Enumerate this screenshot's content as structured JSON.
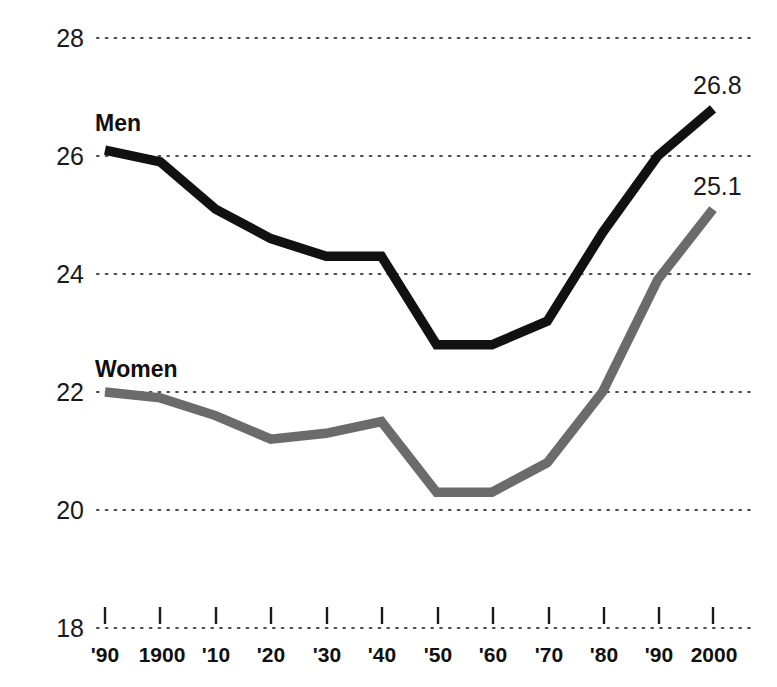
{
  "chart_data": {
    "type": "line",
    "title": "",
    "subtitle": "",
    "xlabel": "",
    "ylabel": "",
    "categories": [
      "'90",
      "1900",
      "'10",
      "'20",
      "'30",
      "'40",
      "'50",
      "'60",
      "'70",
      "'80",
      "'90",
      "2000"
    ],
    "ylim": [
      18,
      28
    ],
    "y_ticks": [
      18,
      20,
      22,
      24,
      26,
      28
    ],
    "y_tick_labels": [
      "18",
      "20",
      "22",
      "24",
      "26",
      "28"
    ],
    "grid": "horizontal-dotted",
    "legend": "inline-labels",
    "series": [
      {
        "name": "Men",
        "color": "#111111",
        "values": [
          26.1,
          25.9,
          25.1,
          24.6,
          24.3,
          24.3,
          22.8,
          22.8,
          23.2,
          24.7,
          26.0,
          26.8
        ],
        "end_label": "26.8",
        "label_position": {
          "x": 95,
          "y": 112
        }
      },
      {
        "name": "Women",
        "color": "#6b6b6b",
        "values": [
          22.0,
          21.9,
          21.6,
          21.2,
          21.3,
          21.5,
          20.3,
          20.3,
          20.8,
          22.0,
          23.9,
          25.1
        ],
        "end_label": "25.1",
        "label_position": {
          "x": 95,
          "y": 358
        }
      }
    ],
    "annotations": [
      {
        "text": "26.8",
        "series": "Men",
        "at_category": "2000"
      },
      {
        "text": "25.1",
        "series": "Women",
        "at_category": "2000"
      }
    ]
  },
  "axis": {
    "y_labels": [
      "28",
      "26",
      "24",
      "22",
      "20",
      "18"
    ],
    "x_labels": [
      "'90",
      "1900",
      "'10",
      "'20",
      "'30",
      "'40",
      "'50",
      "'60",
      "'70",
      "'80",
      "'90",
      "2000"
    ]
  },
  "labels": {
    "men": "Men",
    "women": "Women",
    "men_end_value": "26.8",
    "women_end_value": "25.1"
  },
  "colors": {
    "men_line": "#111111",
    "women_line": "#6b6b6b",
    "grid": "#4d4d4d",
    "text": "#111111",
    "background": "#ffffff"
  }
}
